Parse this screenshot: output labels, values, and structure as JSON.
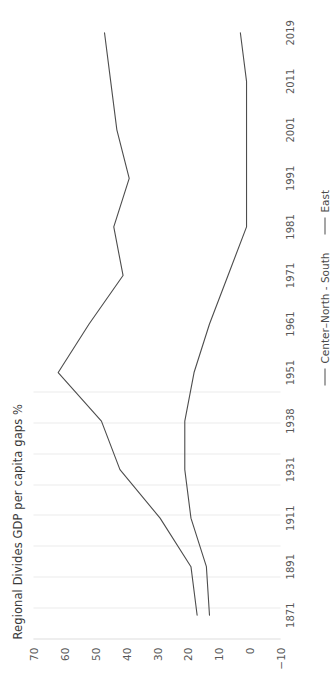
{
  "chart_data": {
    "type": "line",
    "title": "Regional Divides GDP per capita gaps %",
    "xlabel": "",
    "ylabel": "",
    "orientation": "rotated-90-ccw",
    "grid": true,
    "legend_position": "bottom-right",
    "ylim": [
      -10,
      70
    ],
    "yticks": [
      70,
      60,
      50,
      40,
      30,
      20,
      10,
      0,
      -10
    ],
    "categories": [
      "1871",
      "1891",
      "1911",
      "1931",
      "1938",
      "1951",
      "1961",
      "1971",
      "1981",
      "1991",
      "2001",
      "2011",
      "2019"
    ],
    "series": [
      {
        "name": "Center–North - South",
        "color": "#4d4d4d",
        "values": [
          17,
          19,
          29,
          42,
          48,
          62,
          52,
          41,
          44,
          39,
          43,
          45,
          47
        ]
      },
      {
        "name": "East",
        "color": "#4d4d4d",
        "values": [
          13,
          14,
          19,
          21,
          21,
          18,
          13,
          7,
          1,
          1,
          1,
          1,
          3
        ]
      }
    ]
  },
  "legend": {
    "items": [
      {
        "label": "Center–North - South"
      },
      {
        "label": "East"
      }
    ]
  },
  "axis": {
    "value_ticks": [
      "70",
      "60",
      "50",
      "40",
      "30",
      "20",
      "10",
      "0",
      "−10"
    ],
    "category_ticks": [
      "1871",
      "1891",
      "1911",
      "1931",
      "1938",
      "1951",
      "1961",
      "1971",
      "1981",
      "1991",
      "2001",
      "2011",
      "2019"
    ]
  }
}
